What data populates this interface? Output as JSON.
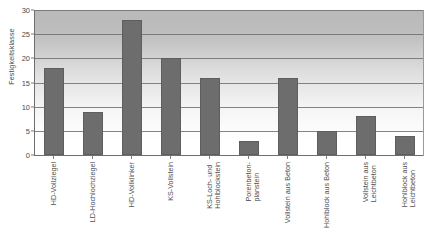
{
  "chart_data": {
    "type": "bar",
    "title": "",
    "subtitle": "",
    "xlabel": "",
    "ylabel": "Festigkeitsklasse",
    "ylim": [
      0,
      30
    ],
    "ytick_values": [
      0,
      5,
      10,
      15,
      20,
      25,
      30
    ],
    "ytick_labels": [
      "0",
      "5",
      "10",
      "15",
      "20",
      "25",
      "30"
    ],
    "grid": true,
    "grid_axis": "y",
    "legend": false,
    "legend_position": "none",
    "bar_color": "#6d6d6d",
    "plot_background": "vertical-gradient-gray-to-white",
    "categories": [
      "HD-Vollziegel",
      "LD-Hochlochziegel",
      "HD-Vollklinker",
      "KS-Vollstein",
      "KS-Loch- und\nHohlblockstein",
      "Porenbeton-\nplanstein",
      "Vollstein aus Beton",
      "Hohlblock aus Beton",
      "Vollstein aus\nLeichtbeton",
      "Hohlblock aus\nLeichtbeton"
    ],
    "values": [
      18,
      9,
      28,
      20,
      16,
      3,
      16,
      5,
      8,
      4
    ]
  }
}
